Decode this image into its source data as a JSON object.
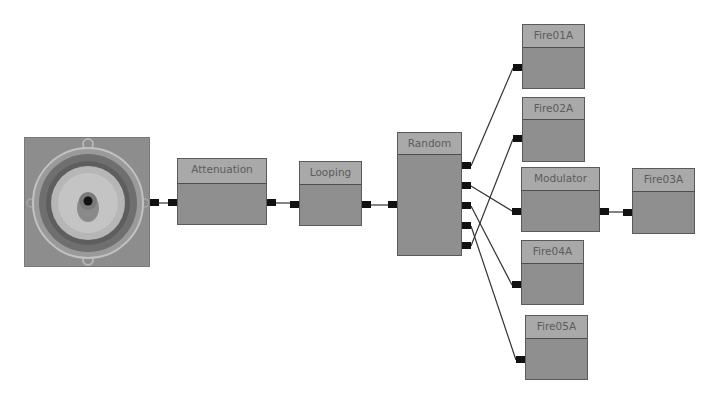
{
  "graph": {
    "title": "sound cue graph",
    "colors": {
      "node_body": "#8f8f8f",
      "node_header": "#a9a9a9",
      "node_border": "#5a5a5a",
      "pin": "#111111",
      "wire": "#333333",
      "background": "#ffffff"
    },
    "output_node": {
      "label": "",
      "icon": "speaker-icon"
    },
    "nodes": [
      {
        "id": "attenuation",
        "label": "Attenuation"
      },
      {
        "id": "looping",
        "label": "Looping"
      },
      {
        "id": "random",
        "label": "Random",
        "outputs": 5
      },
      {
        "id": "fire01a",
        "label": "Fire01A"
      },
      {
        "id": "fire02a",
        "label": "Fire02A"
      },
      {
        "id": "modulator",
        "label": "Modulator"
      },
      {
        "id": "fire03a",
        "label": "Fire03A"
      },
      {
        "id": "fire04a",
        "label": "Fire04A"
      },
      {
        "id": "fire05a",
        "label": "Fire05A"
      }
    ],
    "connections": [
      [
        "speaker",
        "attenuation"
      ],
      [
        "attenuation",
        "looping"
      ],
      [
        "looping",
        "random"
      ],
      [
        "random.out1",
        "fire01a"
      ],
      [
        "random.out2",
        "modulator"
      ],
      [
        "random.out3",
        "fire04a"
      ],
      [
        "random.out4",
        "fire05a"
      ],
      [
        "random.out5",
        "fire02a"
      ],
      [
        "modulator",
        "fire03a"
      ]
    ]
  }
}
